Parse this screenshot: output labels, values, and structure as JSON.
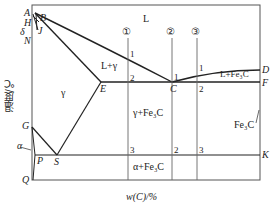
{
  "diagram": {
    "type": "iron-carbon phase diagram",
    "ylabel": "温度/℃",
    "xlabel": "w(C)/%",
    "points": {
      "A": "A",
      "H": "H",
      "B": "B",
      "J": "J",
      "N": "N",
      "delta": "δ",
      "E": "E",
      "C": "C",
      "D": "D",
      "F": "F",
      "G": "G",
      "alpha": "α",
      "P": "P",
      "S": "S",
      "Q": "Q",
      "K": "K"
    },
    "regions": {
      "liquid": "L",
      "l_gamma": "L+γ",
      "gamma": "γ",
      "l_fe3c": "L+Fe₃C",
      "gamma_fe3c": "γ+Fe₃C",
      "fe3c": "Fe₃C",
      "alpha_fe3c": "α+Fe₃C"
    },
    "alloy_markers": [
      "①",
      "②",
      "③"
    ],
    "line1_marks": [
      "1",
      "2",
      "3"
    ],
    "line2_marks": [
      "1",
      "2"
    ],
    "line3_marks": [
      "1",
      "2",
      "3"
    ]
  }
}
